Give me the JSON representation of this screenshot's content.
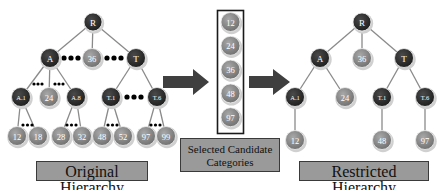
{
  "colors": {
    "internal_node": "#2b2b2b",
    "leaf_node": "#8a8a8a",
    "edge": "#8a8a8a",
    "arrow": "#3f3f3f",
    "label_bg": "#9a9a9a",
    "ellipsis": "#000000"
  },
  "original_hierarchy": {
    "label": "Original Hierarchy",
    "nodes": [
      {
        "id": "R",
        "label": "R",
        "type": "internal",
        "x": 93,
        "y": 22
      },
      {
        "id": "A",
        "label": "A",
        "type": "internal",
        "x": 50,
        "y": 58
      },
      {
        "id": "36",
        "label": "36",
        "type": "leaf",
        "x": 92,
        "y": 58
      },
      {
        "id": "T",
        "label": "T",
        "type": "internal",
        "x": 136,
        "y": 58
      },
      {
        "id": "A.1",
        "label": "A.1",
        "type": "internal",
        "x": 21,
        "y": 97
      },
      {
        "id": "24",
        "label": "24",
        "type": "leaf",
        "x": 49,
        "y": 97
      },
      {
        "id": "A.8",
        "label": "A.8",
        "type": "internal",
        "x": 76,
        "y": 97
      },
      {
        "id": "T.1",
        "label": "T.1",
        "type": "internal",
        "x": 111,
        "y": 97
      },
      {
        "id": "T.6",
        "label": "T.6",
        "type": "internal",
        "x": 157,
        "y": 97
      },
      {
        "id": "12",
        "label": "12",
        "type": "leaf",
        "x": 17,
        "y": 136
      },
      {
        "id": "18",
        "label": "18",
        "type": "leaf",
        "x": 38,
        "y": 136
      },
      {
        "id": "28",
        "label": "28",
        "type": "leaf",
        "x": 61,
        "y": 136
      },
      {
        "id": "32",
        "label": "32",
        "type": "leaf",
        "x": 82,
        "y": 136
      },
      {
        "id": "48",
        "label": "48",
        "type": "leaf",
        "x": 102,
        "y": 136
      },
      {
        "id": "52",
        "label": "52",
        "type": "leaf",
        "x": 123,
        "y": 136
      },
      {
        "id": "97",
        "label": "97",
        "type": "leaf",
        "x": 146,
        "y": 136
      },
      {
        "id": "99",
        "label": "99",
        "type": "leaf",
        "x": 166,
        "y": 136
      }
    ],
    "edges": [
      [
        "R",
        "A"
      ],
      [
        "R",
        "36"
      ],
      [
        "R",
        "T"
      ],
      [
        "A",
        "A.1"
      ],
      [
        "A",
        "24"
      ],
      [
        "A",
        "A.8"
      ],
      [
        "T",
        "T.1"
      ],
      [
        "T",
        "T.6"
      ],
      [
        "A.1",
        "12"
      ],
      [
        "A.1",
        "18"
      ],
      [
        "A.8",
        "28"
      ],
      [
        "A.8",
        "32"
      ],
      [
        "T.1",
        "48"
      ],
      [
        "T.1",
        "52"
      ],
      [
        "T.6",
        "97"
      ],
      [
        "T.6",
        "99"
      ]
    ]
  },
  "selected_candidates": {
    "label": "Selected Candidate Categories",
    "label_line1": "Selected Candidate",
    "label_line2": "Categories",
    "items": [
      "12",
      "24",
      "36",
      "48",
      "97"
    ]
  },
  "restricted_hierarchy": {
    "label": "Restricted Hierarchy",
    "nodes": [
      {
        "id": "R",
        "label": "R",
        "type": "internal",
        "x": 362,
        "y": 22
      },
      {
        "id": "A",
        "label": "A",
        "type": "internal",
        "x": 320,
        "y": 58
      },
      {
        "id": "36",
        "label": "36",
        "type": "leaf",
        "x": 362,
        "y": 58
      },
      {
        "id": "T",
        "label": "T",
        "type": "internal",
        "x": 404,
        "y": 58
      },
      {
        "id": "A.1",
        "label": "A.1",
        "type": "internal",
        "x": 295,
        "y": 97
      },
      {
        "id": "24",
        "label": "24",
        "type": "leaf",
        "x": 345,
        "y": 97
      },
      {
        "id": "T.1",
        "label": "T.1",
        "type": "internal",
        "x": 382,
        "y": 97
      },
      {
        "id": "T.6",
        "label": "T.6",
        "type": "internal",
        "x": 425,
        "y": 97
      },
      {
        "id": "12",
        "label": "12",
        "type": "leaf",
        "x": 295,
        "y": 140
      },
      {
        "id": "48",
        "label": "48",
        "type": "leaf",
        "x": 382,
        "y": 140
      },
      {
        "id": "97",
        "label": "97",
        "type": "leaf",
        "x": 425,
        "y": 140
      }
    ],
    "edges": [
      [
        "R",
        "A"
      ],
      [
        "R",
        "36"
      ],
      [
        "R",
        "T"
      ],
      [
        "A",
        "A.1"
      ],
      [
        "A",
        "24"
      ],
      [
        "T",
        "T.1"
      ],
      [
        "T",
        "T.6"
      ],
      [
        "A.1",
        "12"
      ],
      [
        "T.1",
        "48"
      ],
      [
        "T.6",
        "97"
      ]
    ]
  }
}
